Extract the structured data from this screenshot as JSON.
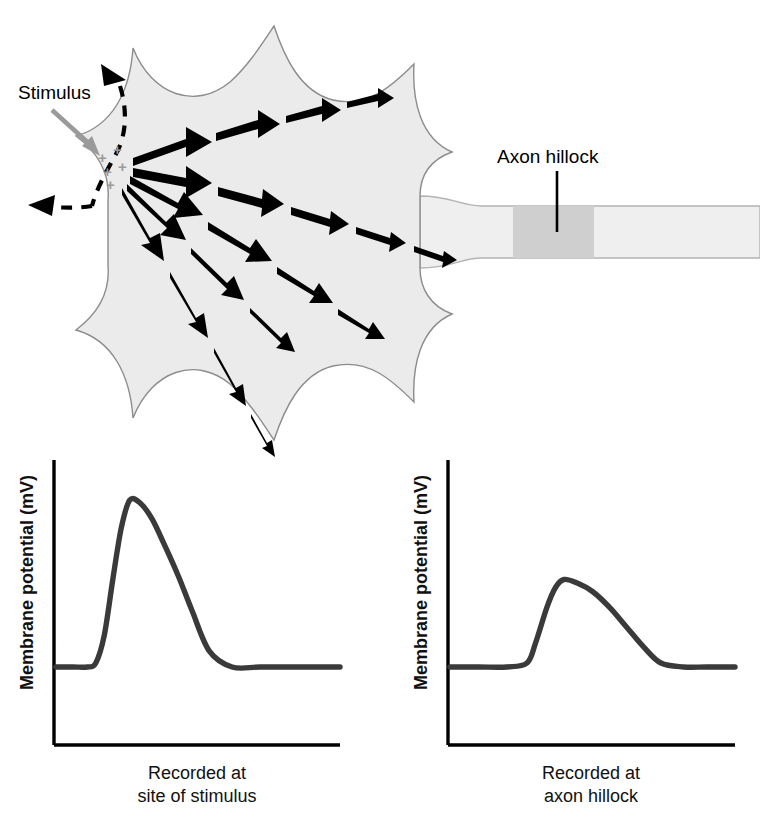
{
  "figure": {
    "title_visible": false,
    "background": "#ffffff"
  },
  "neuron": {
    "soma": {
      "label": "soma",
      "fill": "#ebebeb",
      "stroke": "#8c8c8c"
    },
    "axon": {
      "label": "axon",
      "fill": "#efefef",
      "stroke": "#b4b4b4"
    },
    "hillock_band": {
      "fill": "#cfcfcf"
    },
    "stimulus": {
      "label": "Stimulus",
      "arrow_color": "#9a9a9a"
    },
    "axon_hillock": {
      "label": "Axon hillock",
      "leader_color": "#000000"
    },
    "charges": {
      "symbol": "+",
      "count": 5,
      "color": "#9a9a9a"
    },
    "depolarization_boundary": {
      "label": "spreading depolarization boundary",
      "style": "dashed",
      "color": "#000000"
    },
    "current_rays": {
      "label": "local current flow",
      "color": "#000000",
      "count": 5,
      "note": "arrow segments taper and shorten with distance"
    }
  },
  "chart_data": [
    {
      "type": "line",
      "name": "recorded-at-site-of-stimulus",
      "title": "Recorded at site of stimulus",
      "title_lines": [
        "Recorded at",
        "site of stimulus"
      ],
      "xlabel": "",
      "ylabel": "Membrane potential (mV)",
      "grid": false,
      "legend": false,
      "xlim": [
        0,
        100
      ],
      "ylim": [
        0,
        100
      ],
      "baseline": 30,
      "peak": 72,
      "peak_x": 26,
      "onset_x": 14,
      "return_x": 54,
      "x": [
        0,
        6,
        11,
        14,
        17,
        20,
        23,
        26,
        30,
        34,
        38,
        43,
        48,
        54,
        62,
        72,
        85,
        100
      ],
      "y": [
        30,
        30,
        30,
        31,
        38,
        52,
        65,
        72,
        71,
        67,
        61,
        53,
        44,
        34,
        30,
        30,
        30,
        30
      ],
      "series_color": "#3a3a3a"
    },
    {
      "type": "line",
      "name": "recorded-at-axon-hillock",
      "title": "Recorded at axon hillock",
      "title_lines": [
        "Recorded at",
        "axon hillock"
      ],
      "xlabel": "",
      "ylabel": "Membrane potential (mV)",
      "grid": false,
      "legend": false,
      "xlim": [
        0,
        100
      ],
      "ylim": [
        0,
        100
      ],
      "baseline": 30,
      "peak": 52,
      "peak_x": 40,
      "onset_x": 27,
      "return_x": 70,
      "x": [
        0,
        10,
        20,
        27,
        30,
        34,
        37,
        40,
        45,
        50,
        56,
        62,
        68,
        74,
        82,
        90,
        100
      ],
      "y": [
        30,
        30,
        30,
        31,
        36,
        45,
        50,
        52,
        51,
        49,
        45,
        40,
        35,
        31,
        30,
        30,
        30
      ],
      "series_color": "#3a3a3a"
    }
  ]
}
